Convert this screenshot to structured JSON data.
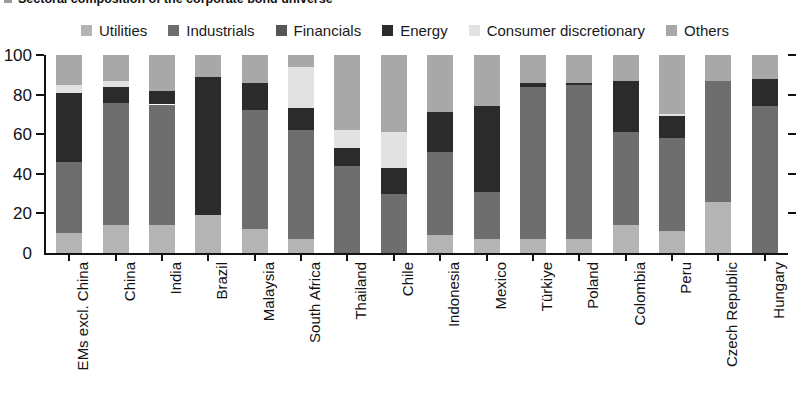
{
  "title": {
    "text": "Sectoral composition of the corporate bond universe",
    "bullet_icon": "square-bullet"
  },
  "legend": {
    "position": "top-center",
    "items": [
      {
        "label": "Utilities",
        "color": "#b4b4b4"
      },
      {
        "label": "Industrials",
        "color": "#6e6e6e"
      },
      {
        "label": "Financials",
        "color": "#565656"
      },
      {
        "label": "Energy",
        "color": "#2b2b2b"
      },
      {
        "label": "Consumer discretionary",
        "color": "#e2e2e2"
      },
      {
        "label": "Others",
        "color": "#a8a8a8"
      }
    ]
  },
  "axis": {
    "y_ticks": [
      0,
      20,
      40,
      60,
      80,
      100
    ],
    "y_min": 0,
    "y_max": 100,
    "grid": false
  },
  "chart_data": {
    "type": "bar",
    "subtype": "stacked-vertical-percentage",
    "title": "Sectoral composition of the corporate bond universe",
    "xlabel": "",
    "ylabel": "",
    "ylim": [
      0,
      100
    ],
    "grid": false,
    "legend_position": "top-center",
    "categories": [
      "EMs excl. China",
      "China",
      "India",
      "Brazil",
      "Malaysia",
      "South Africa",
      "Thailand",
      "Chile",
      "Indonesia",
      "Mexico",
      "Türkiye",
      "Poland",
      "Colombia",
      "Peru",
      "Czech Republic",
      "Hungary"
    ],
    "series": [
      {
        "name": "Utilities",
        "color": "#b4b4b4",
        "values": [
          10,
          14,
          14,
          19,
          12,
          7,
          0,
          0,
          9,
          7,
          7,
          7,
          14,
          11,
          26,
          0
        ]
      },
      {
        "name": "Industrials",
        "color": "#6e6e6e",
        "values": [
          36,
          62,
          61,
          0,
          60,
          55,
          44,
          30,
          42,
          24,
          77,
          78,
          47,
          47,
          61,
          74
        ]
      },
      {
        "name": "Financials",
        "color": "#565656",
        "values": [
          0,
          0,
          0,
          0,
          0,
          0,
          0,
          0,
          0,
          0,
          0,
          0,
          0,
          0,
          0,
          0
        ]
      },
      {
        "name": "Energy",
        "color": "#2b2b2b",
        "values": [
          35,
          8,
          7,
          70,
          14,
          11,
          9,
          13,
          20,
          43,
          2,
          1,
          26,
          11,
          0,
          14
        ]
      },
      {
        "name": "Consumer discretionary",
        "color": "#e2e2e2",
        "values": [
          4,
          3,
          0,
          0,
          0,
          21,
          9,
          18,
          0,
          0,
          0,
          0,
          0,
          1,
          0,
          0
        ]
      },
      {
        "name": "Others",
        "color": "#a8a8a8",
        "values": [
          15,
          13,
          18,
          11,
          14,
          6,
          38,
          39,
          29,
          26,
          14,
          14,
          13,
          30,
          13,
          12
        ]
      }
    ]
  }
}
